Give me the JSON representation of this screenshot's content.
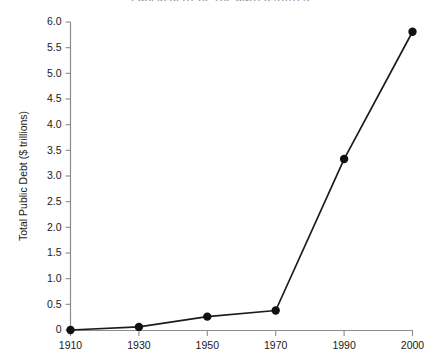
{
  "chart_data": {
    "type": "line",
    "title": "PUBLIC DEBT OF THE UNITED STATES",
    "xlabel": "",
    "ylabel": "Total Public Debt ($ trillions)",
    "categories": [
      "1910",
      "1930",
      "1950",
      "1970",
      "1990",
      "2000"
    ],
    "x": [
      1910,
      1930,
      1950,
      1970,
      1990,
      2000
    ],
    "values": [
      0.0,
      0.06,
      0.26,
      0.38,
      3.33,
      5.81
    ],
    "series": [
      {
        "name": "Total Public Debt",
        "values": [
          0.0,
          0.06,
          0.26,
          0.38,
          3.33,
          5.81
        ]
      }
    ],
    "ylim": [
      0,
      6.0
    ],
    "ytick_values": [
      0,
      0.5,
      1.0,
      1.5,
      2.0,
      2.5,
      3.0,
      3.5,
      4.0,
      4.5,
      5.0,
      5.5,
      6.0
    ],
    "ytick_labels": [
      "0",
      "0.5",
      "1.0",
      "1.5",
      "2.0",
      "2.5",
      "3.0",
      "3.5",
      "4.0",
      "4.5",
      "5.0",
      "5.5",
      "6.0"
    ],
    "xtick_labels": [
      "1910",
      "1930",
      "1950",
      "1970",
      "1990",
      "2000"
    ],
    "grid": false,
    "legend": false,
    "legend_position": "none",
    "marker": "filled-circle",
    "line_color": "#1c1c1c",
    "marker_color": "#111111",
    "axis_color": "#8d8d8d",
    "background_color": "#ffffff"
  }
}
